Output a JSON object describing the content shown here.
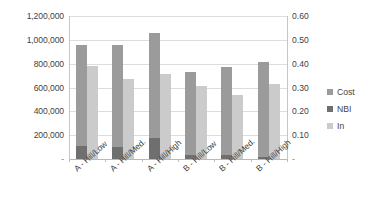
{
  "chart_data": {
    "type": "bar",
    "title": "",
    "subtitle": "",
    "xlabel": "",
    "ylabel": "",
    "grid": true,
    "legend_position": "right",
    "categories": [
      "A - Hill/Low",
      "A - Hill/Med.",
      "A - Hill/High",
      "B - Hill/Low",
      "B - Hill/Med.",
      "B - Hill/High"
    ],
    "axes": {
      "left": {
        "label": "",
        "ylim": [
          0,
          1200000
        ],
        "ticks": [
          0,
          200000,
          400000,
          600000,
          800000,
          1000000,
          1200000
        ],
        "tick_labels": [
          "-",
          "200,000",
          "400,000",
          "600,000",
          "800,000",
          "1,000,000",
          "1,200,000"
        ]
      },
      "right": {
        "label": "",
        "ylim": [
          0,
          0.6
        ],
        "ticks": [
          0,
          0.1,
          0.2,
          0.3,
          0.4,
          0.5,
          0.6
        ],
        "tick_labels": [
          "-",
          "0.10",
          "0.20",
          "0.30",
          "0.40",
          "0.50",
          "0.60"
        ]
      }
    },
    "series": [
      {
        "name": "Cost",
        "axis": "left",
        "color": "#9b9b9b",
        "values": [
          955000,
          955000,
          1060000,
          730000,
          775000,
          810000
        ]
      },
      {
        "name": "NBI",
        "axis": "left",
        "color": "#6f6f6f",
        "values": [
          110000,
          100000,
          180000,
          35000,
          30000,
          15000
        ]
      },
      {
        "name": "In",
        "axis": "right",
        "color": "#cbcbcb",
        "values": [
          0.39,
          0.335,
          0.355,
          0.305,
          0.27,
          0.315
        ]
      }
    ]
  },
  "legend": {
    "items": [
      {
        "label": "Cost",
        "color": "#9b9b9b"
      },
      {
        "label": "NBI",
        "color": "#6f6f6f"
      },
      {
        "label": "In",
        "color": "#cbcbcb"
      }
    ]
  }
}
